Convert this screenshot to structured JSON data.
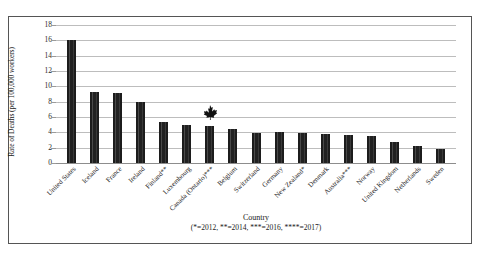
{
  "chart_data": {
    "type": "bar",
    "title": "",
    "xlabel": "Country",
    "xlabel_note": "(*=2012, **=2014, ***=2016, ****=2017)",
    "ylabel": "Rate of Deaths (per 100,000 workers)",
    "ylim": [
      0,
      18
    ],
    "ytick_labels": [
      "18",
      "16",
      "14",
      "12",
      "10",
      "8",
      "6",
      "4",
      "2",
      "0"
    ],
    "ytick_values": [
      18,
      16,
      14,
      12,
      10,
      8,
      6,
      4,
      2,
      0
    ],
    "grid": true,
    "legend": "none",
    "bar_color": "#2b2b2b",
    "categories": [
      "United States",
      "Iceland",
      "France",
      "Ireland",
      "Finland**",
      "Luxembourg",
      "Canada (Ontario)***",
      "Belgium",
      "Switzerland",
      "Germany",
      "New Zealand*",
      "Denmark",
      "Australia***",
      "Norway",
      "United Kingdom",
      "Netherlands",
      "Sweden"
    ],
    "values": [
      16.1,
      9.2,
      9.1,
      8.0,
      5.4,
      5.0,
      4.8,
      4.4,
      3.9,
      4.0,
      3.9,
      3.8,
      3.6,
      3.5,
      2.8,
      2.2,
      1.8
    ],
    "annotations": [
      {
        "name": "maple-leaf-marker",
        "category": "Canada (Ontario)***",
        "icon": "maple-leaf-icon",
        "color": "#111111"
      }
    ]
  }
}
